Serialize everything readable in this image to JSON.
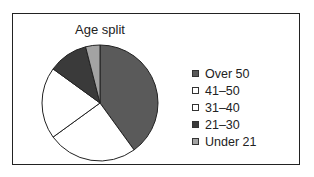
{
  "chart_data": {
    "type": "pie",
    "title": "Age split",
    "categories": [
      "Over 50",
      "41–50",
      "31–40",
      "21–30",
      "Under 21"
    ],
    "values": [
      40,
      25,
      20,
      11,
      4
    ],
    "colors": [
      "#5a5a5a",
      "#ffffff",
      "#ffffff",
      "#3a3a3a",
      "#a3a3a3"
    ],
    "start_angle": "12 o'clock, clockwise",
    "legend_position": "right"
  },
  "title": "Age split",
  "legend": [
    {
      "label": "Over 50",
      "color": "#5a5a5a"
    },
    {
      "label": "41–50",
      "color": "#ffffff"
    },
    {
      "label": "31–40",
      "color": "#ffffff"
    },
    {
      "label": "21–30",
      "color": "#3a3a3a"
    },
    {
      "label": "Under 21",
      "color": "#a3a3a3"
    }
  ]
}
